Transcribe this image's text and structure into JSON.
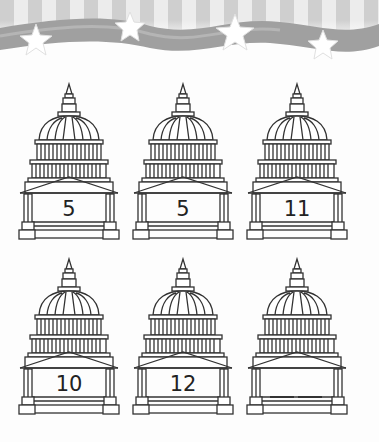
{
  "banner": {
    "description": "stars and stripes wave banner",
    "stars": 4
  },
  "worksheet": {
    "pattern_type": "number sequence",
    "rows": [
      {
        "items": [
          {
            "value": "5",
            "blank": false
          },
          {
            "value": "5",
            "blank": false
          },
          {
            "value": "11",
            "blank": false
          }
        ]
      },
      {
        "items": [
          {
            "value": "10",
            "blank": false
          },
          {
            "value": "12",
            "blank": false
          },
          {
            "value": "",
            "blank": true,
            "blank_lines": 2
          }
        ]
      }
    ]
  },
  "colors": {
    "stripe_light": "#e8e8e8",
    "stripe_dark": "#c9c9c9",
    "ribbon": "#9a9a9a",
    "line": "#333333",
    "background": "#fdfdfd"
  }
}
